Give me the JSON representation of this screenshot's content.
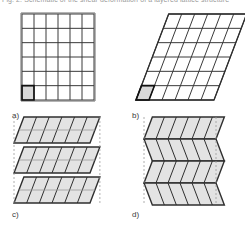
{
  "caption": {
    "top_line": "Fig. 2. Schematic of the shear deformation of a layered lattice structure"
  },
  "figure": {
    "name": "lattice-shear-deformation-figure",
    "panels": [
      {
        "id": "a",
        "label": "a)",
        "type": "square-grid",
        "description": "Undeformed square lattice",
        "rows": 6,
        "cols": 6,
        "shear": 0,
        "highlight_cell": {
          "row": 5,
          "col": 0
        },
        "fill": "#ffffff",
        "highlight_fill": "#d8d8d8",
        "stroke": "#3a3a3a",
        "outline_stroke": "#6b6b6b"
      },
      {
        "id": "b",
        "label": "b)",
        "type": "sheared-grid",
        "description": "Uniformly sheared lattice",
        "rows": 6,
        "cols": 6,
        "shear": 0.38,
        "highlight_cell": {
          "row": 5,
          "col": 0
        },
        "fill": "#ffffff",
        "highlight_fill": "#d8d8d8",
        "stroke": "#3a3a3a",
        "outline_stroke": "#2f2f2f"
      },
      {
        "id": "c",
        "label": "c)",
        "type": "stacked-sheared-layers",
        "description": "Three stacked layers sheared in the same direction",
        "layers": 3,
        "rows_per_layer": 2,
        "cols": 6,
        "shear": 0.38,
        "fill": "#e3e3e3",
        "stroke": "#2f2f2f",
        "guide_stroke": "#9a9a9a",
        "guide_style": "dashed"
      },
      {
        "id": "d",
        "label": "d)",
        "type": "alternating-sheared-layers",
        "description": "Four stacked layers sheared in alternating directions (chevron)",
        "layers": 4,
        "rows_per_layer": 1,
        "cols": 6,
        "shear": 0.38,
        "fill": "#e3e3e3",
        "stroke": "#2f2f2f",
        "guide_stroke": "#9a9a9a",
        "guide_style": "dashed"
      }
    ]
  },
  "colors": {
    "background": "#ffffff",
    "line": "#3a3a3a",
    "line_dark": "#2f2f2f",
    "fill_light": "#e3e3e3",
    "fill_highlight": "#d8d8d8",
    "guide": "#9a9a9a",
    "caption_text": "#9a9a9a",
    "label_text": "#3a3a3a"
  }
}
